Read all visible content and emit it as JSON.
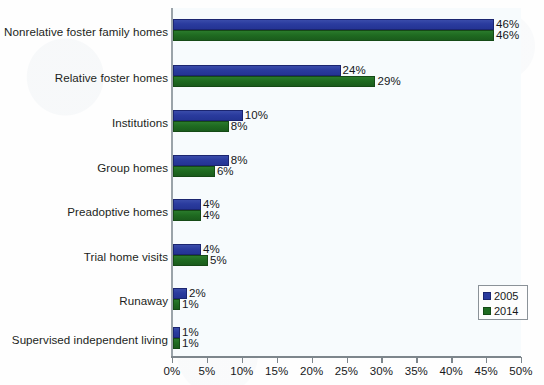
{
  "chart_data": {
    "type": "bar",
    "orientation": "horizontal",
    "title": "",
    "subtitle": "",
    "xlabel": "",
    "ylabel": "",
    "xlim": [
      0,
      50
    ],
    "xtick_values": [
      0,
      5,
      10,
      15,
      20,
      25,
      30,
      35,
      40,
      45,
      50
    ],
    "xtick_labels": [
      "0%",
      "5%",
      "10%",
      "15%",
      "20%",
      "25%",
      "30%",
      "35%",
      "40%",
      "45%",
      "50%"
    ],
    "grid": false,
    "legend_position": "bottom-right",
    "value_suffix": "%",
    "categories": [
      "Nonrelative foster family homes",
      "Relative foster homes",
      "Institutions",
      "Group homes",
      "Preadoptive homes",
      "Trial home visits",
      "Runaway",
      "Supervised independent living"
    ],
    "series": [
      {
        "name": "2005",
        "color": "#2a3b9e",
        "values": [
          46,
          24,
          10,
          8,
          4,
          4,
          2,
          1
        ],
        "labels": [
          "46%",
          "24%",
          "10%",
          "8%",
          "4%",
          "4%",
          "2%",
          "1%"
        ]
      },
      {
        "name": "2014",
        "color": "#1f6b21",
        "values": [
          46,
          29,
          8,
          6,
          4,
          5,
          1,
          1
        ],
        "labels": [
          "46%",
          "29%",
          "8%",
          "6%",
          "4%",
          "5%",
          "1%",
          "1%"
        ]
      }
    ]
  },
  "legend": {
    "entries": [
      {
        "label": "2005",
        "color": "#2a3b9e"
      },
      {
        "label": "2014",
        "color": "#1f6b21"
      }
    ]
  }
}
